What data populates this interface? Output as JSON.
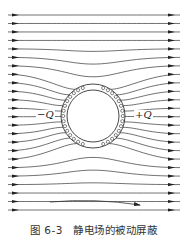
{
  "figure": {
    "caption_number": "图 6-3",
    "caption_text": "静电场的被动屏蔽",
    "charge_left": "−Q",
    "charge_right": "+Q",
    "field_direction": "left-to-right",
    "colors": {
      "line": "#333333",
      "background": "#ffffff"
    },
    "shield": {
      "cx": 93,
      "cy": 116,
      "outer_r": 32,
      "inner_r": 26
    },
    "field_lines_count": 24
  }
}
